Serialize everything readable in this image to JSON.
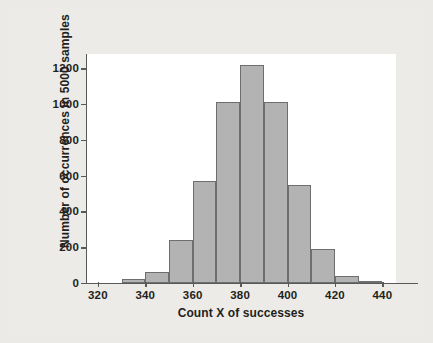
{
  "chart_data": {
    "type": "bar",
    "title": "",
    "subtitle": "",
    "xlabel": "Count X of successes",
    "ylabel": "Number of occurrences in 5000 samples",
    "xlim": [
      315,
      455
    ],
    "ylim": [
      0,
      1280
    ],
    "xticks": [
      320,
      340,
      360,
      380,
      400,
      420,
      440
    ],
    "yticks": [
      0,
      200,
      400,
      600,
      800,
      1000,
      1200
    ],
    "xtick_labels": [
      "320",
      "340",
      "360",
      "380",
      "400",
      "420",
      "440"
    ],
    "ytick_labels": [
      "0",
      "200",
      "400",
      "600",
      "800",
      "1000",
      "1200"
    ],
    "grid": false,
    "legend": null,
    "bin_width": 10,
    "bins": [
      {
        "start": 320,
        "end": 330,
        "value": 0
      },
      {
        "start": 330,
        "end": 340,
        "value": 20
      },
      {
        "start": 340,
        "end": 350,
        "value": 60
      },
      {
        "start": 350,
        "end": 360,
        "value": 240
      },
      {
        "start": 360,
        "end": 370,
        "value": 570
      },
      {
        "start": 370,
        "end": 380,
        "value": 1010
      },
      {
        "start": 380,
        "end": 390,
        "value": 1220
      },
      {
        "start": 390,
        "end": 400,
        "value": 1010
      },
      {
        "start": 400,
        "end": 410,
        "value": 550
      },
      {
        "start": 410,
        "end": 420,
        "value": 190
      },
      {
        "start": 420,
        "end": 430,
        "value": 40
      },
      {
        "start": 430,
        "end": 440,
        "value": 10
      }
    ],
    "categories": [
      "320-330",
      "330-340",
      "340-350",
      "350-360",
      "360-370",
      "370-380",
      "380-390",
      "390-400",
      "400-410",
      "410-420",
      "420-430",
      "430-440"
    ],
    "values": [
      0,
      20,
      60,
      240,
      570,
      1010,
      1220,
      1010,
      550,
      190,
      40,
      10
    ],
    "colors": {
      "bar_fill": "#b3b3b3",
      "bar_border": "#6d6e70",
      "axis": "#58595b",
      "text": "#231f20",
      "plot_background": "#ffffff",
      "page_background": "#edebe7"
    }
  }
}
